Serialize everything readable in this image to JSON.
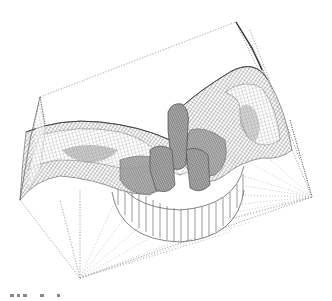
{
  "figure": {
    "colors": {
      "background": "#ffffff",
      "wire_dark": "#4a4a4a",
      "wire_mid": "#7a7a7a",
      "wire_light": "#b0b0b0"
    },
    "bounding_frame_vertices": [
      [
        40,
        97
      ],
      [
        236,
        22
      ],
      [
        312,
        197
      ],
      [
        80,
        278
      ],
      [
        14,
        197
      ]
    ],
    "hub_center": [
      180,
      185
    ],
    "bottom_marks_count": 5
  }
}
